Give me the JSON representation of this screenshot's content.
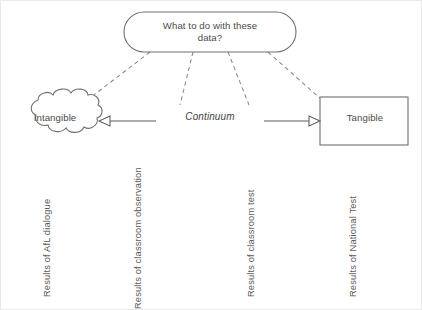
{
  "diagram": {
    "title_node": {
      "id": "question-node",
      "shape": "rounded-rectangle",
      "text": "What to do with these\ndata?"
    },
    "left_node": {
      "id": "intangible-node",
      "shape": "cloud",
      "text": "Intangible"
    },
    "right_node": {
      "id": "tangible-node",
      "shape": "rectangle",
      "text": "Tangible"
    },
    "axis": {
      "label": "Continuum",
      "style": "italic",
      "arrow_left": true,
      "arrow_right": true
    },
    "captions": [
      {
        "text": "Results of AfL dialogue"
      },
      {
        "text": "Results of classroom observation"
      },
      {
        "text": "Results of classroom test"
      },
      {
        "text": "Results of National Test"
      }
    ],
    "colors": {
      "stroke": "#6f6f6f",
      "dashed_stroke": "#8a8a8a",
      "text": "#4a4a4a",
      "background": "#ffffff"
    }
  }
}
